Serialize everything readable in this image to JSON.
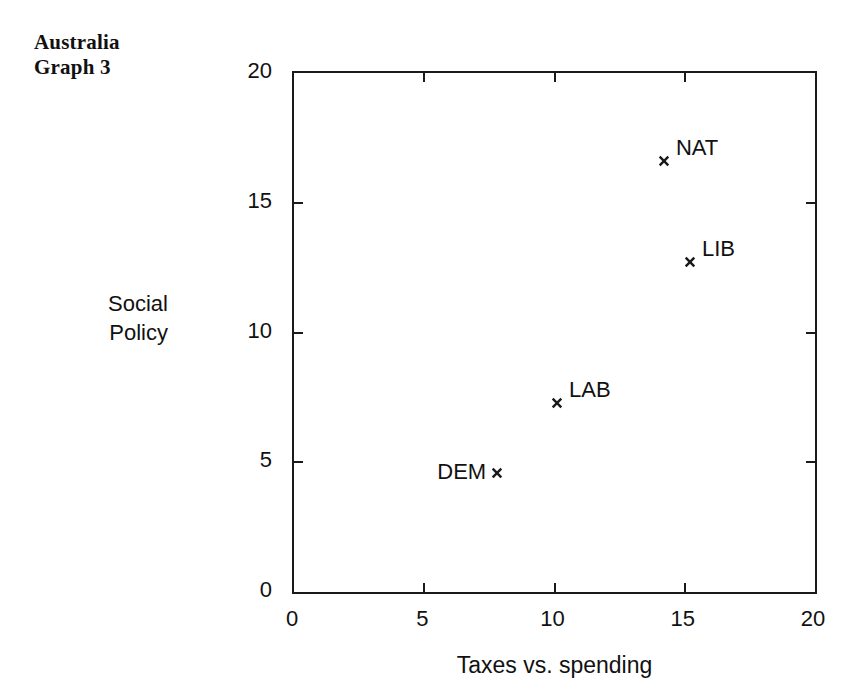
{
  "title": {
    "line1": "Australia",
    "line2": "Graph 3"
  },
  "chart_data": {
    "type": "scatter",
    "title": "Australia Graph 3",
    "xlabel": "Taxes vs. spending",
    "ylabel": "Social Policy",
    "ylabel_line1": "Social",
    "ylabel_line2": "Policy",
    "xlim": [
      0,
      20
    ],
    "ylim": [
      0,
      20
    ],
    "xticks": [
      0,
      5,
      10,
      15,
      20
    ],
    "yticks": [
      0,
      5,
      10,
      15,
      20
    ],
    "xtick_labels": [
      "0",
      "5",
      "10",
      "15",
      "20"
    ],
    "ytick_labels": [
      "0",
      "5",
      "10",
      "15",
      "20"
    ],
    "grid": false,
    "legend": "none",
    "frame": "box",
    "tick_direction": "in",
    "marker": "x",
    "points": [
      {
        "label": "NAT",
        "x": 14.2,
        "y": 16.6,
        "label_side": "right"
      },
      {
        "label": "LIB",
        "x": 15.2,
        "y": 12.7,
        "label_side": "right"
      },
      {
        "label": "LAB",
        "x": 10.1,
        "y": 7.3,
        "label_side": "right"
      },
      {
        "label": "DEM",
        "x": 7.8,
        "y": 4.6,
        "label_side": "left"
      }
    ]
  },
  "colors": {
    "ink": "#1a1a1a",
    "background": "#ffffff"
  }
}
